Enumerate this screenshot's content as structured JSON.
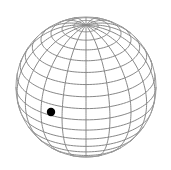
{
  "figure": {
    "kind": "wireframe-globe",
    "background_color": "#ffffff",
    "line_color": "#888888",
    "faint_line_color": "#b4b4b4",
    "limb_color": "#9a9a9a",
    "marker_color": "#000000",
    "canvas": {
      "width": 171,
      "height": 170
    }
  },
  "sphere": {
    "center_x": 86,
    "center_y": 87,
    "radius": 70,
    "tilt_degrees": 28,
    "rotation_degrees": 0,
    "north_pole_visible": true,
    "south_pole_visible": false
  },
  "graticule": {
    "meridian_count": 18,
    "meridian_spacing_degrees": 20,
    "parallel_count": 17,
    "parallel_spacing_degrees": 10,
    "latitudes": [
      -80,
      -70,
      -60,
      -50,
      -40,
      -30,
      -20,
      -10,
      0,
      10,
      20,
      30,
      40,
      50,
      60,
      70,
      80
    ],
    "longitudes": [
      0,
      20,
      40,
      60,
      80,
      100,
      120,
      140,
      160,
      180,
      200,
      220,
      240,
      260,
      280,
      300,
      320,
      340
    ]
  },
  "marker": {
    "label": "point-marker",
    "x": 51,
    "y": 112,
    "radius": 4.2,
    "latitude": -18,
    "longitude": -118
  }
}
